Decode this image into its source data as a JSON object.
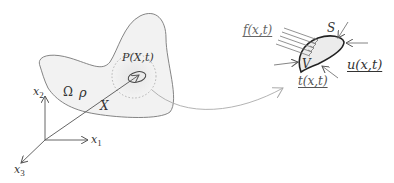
{
  "diagram": {
    "colors": {
      "stroke": "#555555",
      "body_fill": "#f2f2f2",
      "dotted_circle": "#aaaaaa",
      "volume_stroke": "#222222",
      "volume_fill": "#ececec",
      "arrow_curve": "#aaaaaa"
    },
    "body": {
      "domain_label": "Ω",
      "density_label": "ρ",
      "point_label": "P(X,t)",
      "position_vector_label": "X"
    },
    "axes": {
      "x1_label": "x",
      "x1_sub": "1",
      "x2_label": "x",
      "x2_sub": "2",
      "x3_label": "x",
      "x3_sub": "3"
    },
    "control_volume": {
      "surface_label": "S",
      "volume_label": "V",
      "body_force_label": "f(x,t)",
      "traction_label": "t(x,t)",
      "displacement_label": "u(x,t)"
    }
  }
}
